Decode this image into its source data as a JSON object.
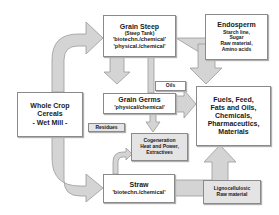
{
  "diagram": {
    "colors": {
      "arrow_fill": "#d4d4d4",
      "arrow_stroke": "#9a9a9a",
      "box_border": "#8a8a8a",
      "label_bg": "#e4e4e4"
    },
    "nodes": {
      "whole_crop": {
        "line1": "Whole Crop",
        "line2": "Cereals",
        "line3": "- Wet Mill -"
      },
      "grain_steep": {
        "title": "Grain Steep",
        "sub": "(Steep Tank)",
        "line1": "'biotechn./chemical'",
        "line2": "'physical./chemical'"
      },
      "endosperm": {
        "title": "Endosperm",
        "line1": "Starch line,",
        "line2": "Sugar",
        "line3": "Raw material,",
        "line4": "Amino acids"
      },
      "grain_germs": {
        "title": "Grain Germs",
        "line1": "'physical/chemical'"
      },
      "products": {
        "line1": "Fuels, Feed,",
        "line2": "Fats and Oils,",
        "line3": "Chemicals,",
        "line4": "Pharmaceutics,",
        "line5": "Materials"
      },
      "cogeneration": {
        "line1": "Cogeneration",
        "line2": "Heat and Power,",
        "line3": "Extractives"
      },
      "straw": {
        "title": "Straw",
        "line1": "'biotechn./chemical'"
      },
      "lignocellulosic": {
        "line1": "Lignocellulosic",
        "line2": "Raw material"
      }
    },
    "labels": {
      "oils": "Oils",
      "residues": "Residues"
    }
  }
}
